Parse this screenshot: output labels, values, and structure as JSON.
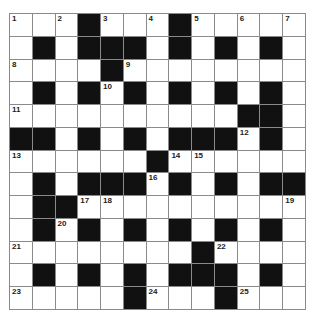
{
  "puzzle": {
    "rows": 13,
    "cols": 13,
    "colors": {
      "block": "#111111",
      "cell": "#ffffff",
      "gridline": "#8a8a8a",
      "number": "#222222"
    },
    "layout": [
      "...#...#.....",
      ".#.###.#.#.#.",
      "....#........",
      ".#.#.#.#.#.#.",
      "..........##.",
      "##.#.#.###.#.",
      "......#......",
      ".#.###.#.#.##",
      ".##..........",
      ".#.#.#.#.#.#.",
      "........#....",
      ".#.#.#.###.#.",
      ".....#...#..."
    ],
    "numbers": [
      {
        "r": 0,
        "c": 0,
        "n": "1"
      },
      {
        "r": 0,
        "c": 2,
        "n": "2"
      },
      {
        "r": 0,
        "c": 4,
        "n": "3"
      },
      {
        "r": 0,
        "c": 6,
        "n": "4"
      },
      {
        "r": 0,
        "c": 8,
        "n": "5"
      },
      {
        "r": 0,
        "c": 10,
        "n": "6"
      },
      {
        "r": 0,
        "c": 12,
        "n": "7"
      },
      {
        "r": 2,
        "c": 0,
        "n": "8"
      },
      {
        "r": 2,
        "c": 5,
        "n": "9"
      },
      {
        "r": 3,
        "c": 4,
        "n": "10"
      },
      {
        "r": 4,
        "c": 0,
        "n": "11"
      },
      {
        "r": 5,
        "c": 10,
        "n": "12"
      },
      {
        "r": 6,
        "c": 0,
        "n": "13"
      },
      {
        "r": 6,
        "c": 7,
        "n": "14"
      },
      {
        "r": 6,
        "c": 8,
        "n": "15"
      },
      {
        "r": 7,
        "c": 6,
        "n": "16"
      },
      {
        "r": 8,
        "c": 3,
        "n": "17"
      },
      {
        "r": 8,
        "c": 4,
        "n": "18"
      },
      {
        "r": 8,
        "c": 12,
        "n": "19"
      },
      {
        "r": 9,
        "c": 2,
        "n": "20"
      },
      {
        "r": 10,
        "c": 0,
        "n": "21"
      },
      {
        "r": 10,
        "c": 9,
        "n": "22"
      },
      {
        "r": 12,
        "c": 0,
        "n": "23"
      },
      {
        "r": 12,
        "c": 6,
        "n": "24"
      },
      {
        "r": 12,
        "c": 10,
        "n": "25"
      }
    ]
  }
}
